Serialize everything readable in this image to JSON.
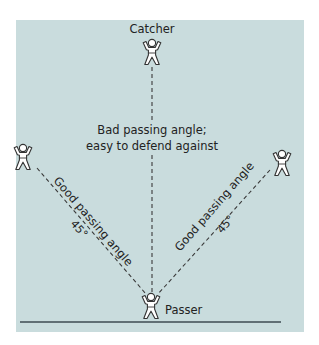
{
  "diagram": {
    "colors": {
      "panel_background": "#c9dcdd",
      "line": "#3a3a3a",
      "ground_line": "#3c4b50",
      "figure_fill": "#ffffff",
      "text": "#222222"
    },
    "players": {
      "catcher": {
        "label": "Catcher"
      },
      "passer": {
        "label": "Passer"
      },
      "left_receiver": {
        "label": ""
      },
      "right_receiver": {
        "label": ""
      }
    },
    "lines": {
      "vertical": {
        "label_line1": "Bad passing angle;",
        "label_line2": "easy to defend against"
      },
      "left_diagonal": {
        "label": "Good passing angle",
        "angle": "45°"
      },
      "right_diagonal": {
        "label": "Good passing angle",
        "angle": "45°"
      }
    }
  }
}
